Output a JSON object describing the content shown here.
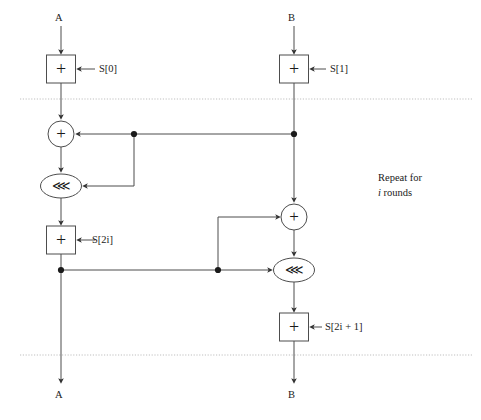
{
  "diagram": {
    "stroke_color": "#4d4d4d",
    "text_color": "#1a1a1a",
    "dotted_color": "#b0b0b0",
    "inputs": [
      {
        "id": "in-a",
        "label": "A",
        "x": 58,
        "y": 18
      },
      {
        "id": "in-b",
        "label": "B",
        "x": 290,
        "y": 18
      }
    ],
    "outputs": [
      {
        "id": "out-a",
        "label": "A",
        "x": 58,
        "y": 396
      },
      {
        "id": "out-b",
        "label": "B",
        "x": 290,
        "y": 396
      }
    ],
    "subkeys": [
      {
        "id": "s0",
        "label": "S[0]",
        "x": 99,
        "y": 64,
        "italic_part": ""
      },
      {
        "id": "s1",
        "label": "S[1]",
        "x": 330,
        "y": 64,
        "italic_part": ""
      },
      {
        "id": "s2i",
        "label": "S[2i]",
        "x": 92,
        "y": 235,
        "italic_part": "i"
      },
      {
        "id": "s2i1",
        "label": "S[2i + 1]",
        "x": 325,
        "y": 322,
        "italic_part": "i"
      }
    ],
    "operators": {
      "xor_box_glyph": "+",
      "xor_circle_glyph": "+",
      "rotate_glyph": "⋘"
    },
    "boxes": [
      {
        "id": "add-s0",
        "kind": "box",
        "op": "+",
        "cx": 61,
        "cy": 69,
        "w": 29,
        "h": 28
      },
      {
        "id": "add-s1",
        "kind": "box",
        "op": "+",
        "cx": 294,
        "cy": 69,
        "w": 29,
        "h": 28
      },
      {
        "id": "add-s2i",
        "kind": "box",
        "op": "+",
        "cx": 61,
        "cy": 240,
        "w": 29,
        "h": 28
      },
      {
        "id": "add-s2i1",
        "kind": "box",
        "op": "+",
        "cx": 294,
        "cy": 327,
        "w": 29,
        "h": 28
      },
      {
        "id": "xor-left",
        "kind": "circle",
        "op": "+",
        "cx": 61,
        "cy": 134,
        "r": 13
      },
      {
        "id": "xor-right",
        "kind": "circle",
        "op": "+",
        "cx": 294,
        "cy": 217,
        "r": 13
      },
      {
        "id": "rot-left",
        "kind": "ellipse",
        "op": "⋘",
        "cx": 61,
        "cy": 186,
        "rx": 20,
        "ry": 12
      },
      {
        "id": "rot-right",
        "kind": "ellipse",
        "op": "⋘",
        "cx": 294,
        "cy": 270,
        "rx": 20,
        "ry": 12
      }
    ],
    "junctions": [
      {
        "id": "tap-b-top",
        "x": 294,
        "y": 134
      },
      {
        "id": "tap-mid",
        "x": 134,
        "y": 134
      },
      {
        "id": "tap-a-low",
        "x": 61,
        "y": 270
      },
      {
        "id": "tap-low-mid",
        "x": 218,
        "y": 270
      }
    ],
    "round_boundaries": [
      {
        "id": "boundary-top",
        "y": 99
      },
      {
        "id": "boundary-bottom",
        "y": 355
      }
    ],
    "annotation": {
      "id": "repeat-note",
      "line1": "Repeat for",
      "line2_italic": "i",
      "line2_rest": " rounds",
      "x": 378,
      "y": 176
    }
  }
}
